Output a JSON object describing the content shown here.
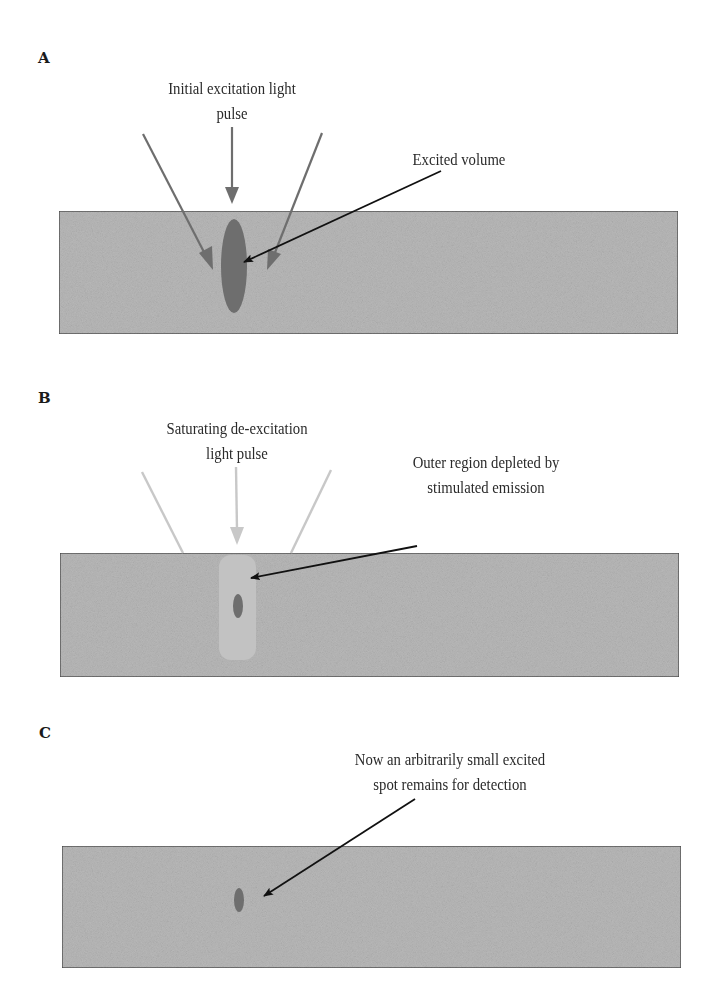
{
  "figure": {
    "colors": {
      "slab_fill": "#b9b9b9",
      "slab_border": "#4a4a4a",
      "excited_fill": "#6e6e6e",
      "excitation_arrow": "#6e6e6e",
      "deexcitation_arrow": "#c8c8c8",
      "depleted_region": "#c2c2c2",
      "pointer_arrow": "#111111"
    },
    "panels": [
      {
        "label": "A",
        "beam_caption_line1": "Initial excitation light",
        "beam_caption_line2": "pulse",
        "pointer_caption_line1": "Excited volume",
        "pointer_caption_line2": ""
      },
      {
        "label": "B",
        "beam_caption_line1": "Saturating de-excitation",
        "beam_caption_line2": "light pulse",
        "pointer_caption_line1": "Outer region depleted by",
        "pointer_caption_line2": "stimulated emission"
      },
      {
        "label": "C",
        "beam_caption_line1": "",
        "beam_caption_line2": "",
        "pointer_caption_line1": "Now an arbitrarily small excited",
        "pointer_caption_line2": "spot remains for detection"
      }
    ]
  }
}
